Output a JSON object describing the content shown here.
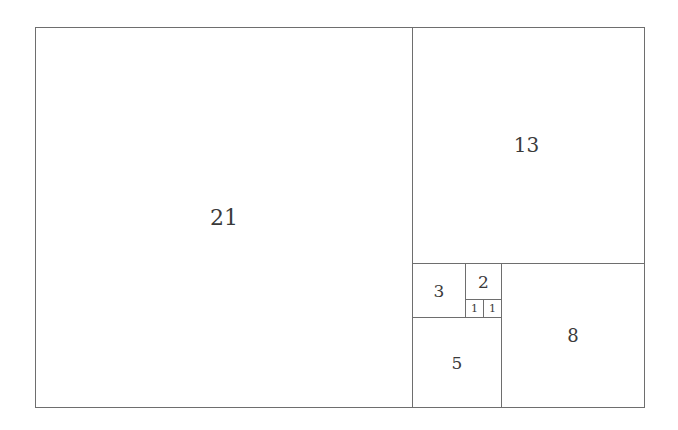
{
  "diagram": {
    "squares": [
      {
        "label": "21",
        "x": 35,
        "y": 27,
        "size": 378,
        "font": 22
      },
      {
        "label": "13",
        "x": 412,
        "y": 27,
        "size": 237,
        "w": 233,
        "font": 20
      },
      {
        "label": "8",
        "x": 501,
        "y": 263,
        "w": 143,
        "h": 145,
        "font": 18
      },
      {
        "label": "5",
        "x": 412,
        "y": 317,
        "w": 90,
        "h": 91,
        "font": 17
      },
      {
        "label": "3",
        "x": 412,
        "y": 263,
        "w": 54,
        "h": 55,
        "font": 17
      },
      {
        "label": "2",
        "x": 465,
        "y": 263,
        "w": 37,
        "h": 37,
        "font": 17
      },
      {
        "label": "1",
        "x": 465,
        "y": 299,
        "w": 19,
        "h": 19,
        "font": 11
      },
      {
        "label": "1",
        "x": 483,
        "y": 299,
        "w": 19,
        "h": 19,
        "font": 11
      }
    ]
  }
}
